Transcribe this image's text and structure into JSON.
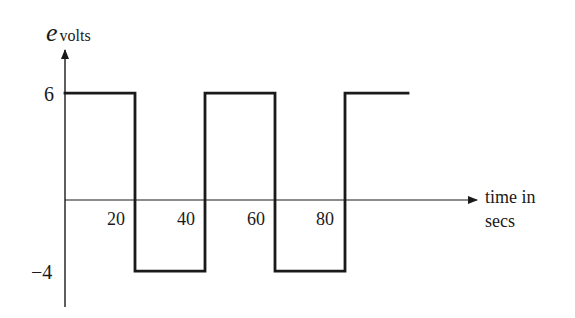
{
  "chart_data": {
    "type": "line",
    "subtype": "square-wave (step)",
    "title": "",
    "ylabel": {
      "symbol": "e",
      "subscript": "volts"
    },
    "xlabel": [
      "time in",
      "secs"
    ],
    "x_ticks": [
      20,
      40,
      60,
      80
    ],
    "y_ticks": [
      6,
      -4
    ],
    "x_tick_labels": [
      "20",
      "40",
      "60",
      "80"
    ],
    "y_tick_labels": [
      "6",
      "−4"
    ],
    "xlim": [
      0,
      118
    ],
    "ylim": [
      -6,
      8.5
    ],
    "grid": false,
    "legend": null,
    "series": [
      {
        "name": "e",
        "step": true,
        "points": [
          {
            "t": 0,
            "e": 6
          },
          {
            "t": 20,
            "e": 6
          },
          {
            "t": 20,
            "e": -4
          },
          {
            "t": 40,
            "e": -4
          },
          {
            "t": 40,
            "e": 6
          },
          {
            "t": 60,
            "e": 6
          },
          {
            "t": 60,
            "e": -4
          },
          {
            "t": 80,
            "e": -4
          },
          {
            "t": 80,
            "e": 6
          },
          {
            "t": 98,
            "e": 6
          }
        ]
      }
    ],
    "segments": [
      {
        "from": 0,
        "to": 20,
        "value": 6
      },
      {
        "from": 20,
        "to": 40,
        "value": -4
      },
      {
        "from": 40,
        "to": 60,
        "value": 6
      },
      {
        "from": 60,
        "to": 80,
        "value": -4
      },
      {
        "from": 80,
        "to": 98,
        "value": 6
      }
    ]
  },
  "labels": {
    "y_symbol": "e",
    "y_subscript": "volts",
    "y_tick_6": "6",
    "y_tick_neg4": "−4",
    "x_tick_20": "20",
    "x_tick_40": "40",
    "x_tick_60": "60",
    "x_tick_80": "80",
    "x_axis_line1": "time in",
    "x_axis_line2": "secs"
  },
  "colors": {
    "ink": "#1a1a1a",
    "background": "#ffffff"
  }
}
